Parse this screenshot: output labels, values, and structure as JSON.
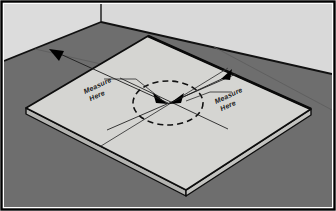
{
  "figure": {
    "frame": {
      "border_color": "#000000",
      "border_width_px": 2,
      "background": "#ffffff"
    },
    "colors": {
      "wall_left": "#dcdcdc",
      "wall_right": "#d9d9d9",
      "floor": "#6e6e6e",
      "slab_top": "#d5d5d2",
      "slab_edge_front": "#c3c3c0",
      "slab_edge_side": "#b4b4b1",
      "outline": "#0d0d0d",
      "annotation": "#1a1a1a"
    },
    "scene": {
      "wall_corner_label": "wall-corner",
      "floor_label": "floor",
      "slab_label": "concrete-slab"
    },
    "annotations": {
      "center_marker": "dashed-ellipse-center-target",
      "arrowheads_center_count": 2,
      "left_label_line1": "Measure",
      "left_label_line2": "Here",
      "right_label_line1": "Measure",
      "right_label_line2": "Here",
      "left_arrow_name": "measure-arrow-left",
      "right_arrow_name": "measure-arrow-right",
      "diagonal_axis_1": "diagonal-line-a",
      "diagonal_axis_2": "diagonal-line-b"
    }
  }
}
